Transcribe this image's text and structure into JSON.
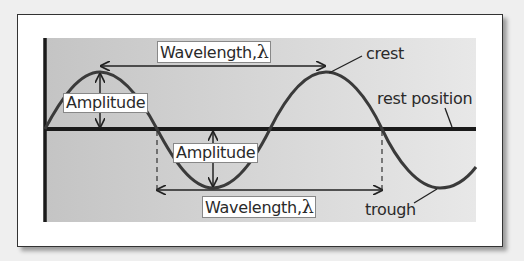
{
  "diagram": {
    "type": "transverse-wave",
    "labels": {
      "wavelength_top": "Wavelength,",
      "wavelength_bottom": "Wavelength,",
      "lambda_symbol": "λ",
      "amplitude_top": "Amplitude",
      "amplitude_bottom": "Amplitude",
      "crest": "crest",
      "rest_position": "rest position",
      "trough": "trough"
    },
    "colors": {
      "background": "#efefef",
      "frame": "#ffffff",
      "panel_dark": "#c4c4c4",
      "panel_light": "#e8e8e8",
      "wave": "#3a3a3a",
      "rest_line": "#1a1a1a"
    }
  }
}
